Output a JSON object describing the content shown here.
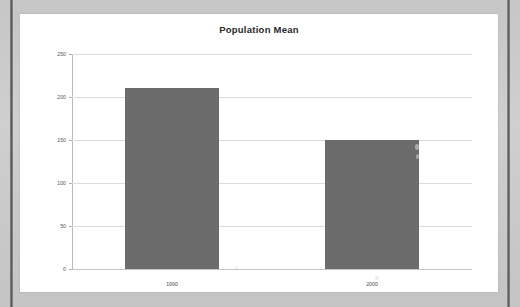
{
  "document": {
    "type": "scanned-page",
    "page_background_color": "#c9c9c9",
    "card_background_color": "#ffffff"
  },
  "chart_data": {
    "type": "bar",
    "title": "Population Mean",
    "xlabel": "",
    "ylabel": "",
    "categories": [
      "1990",
      "2000"
    ],
    "values": [
      210,
      150
    ],
    "ylim": [
      0,
      250
    ],
    "yticks": [
      0,
      50,
      100,
      150,
      200,
      250
    ],
    "ytick_labels": [
      "0",
      "50",
      "100",
      "150",
      "200",
      "250"
    ],
    "grid": true,
    "legend": false,
    "bar_color": "#6b6b6b",
    "gridline_color": "#dcdcdc",
    "axis_color": "#b9b9b9"
  }
}
